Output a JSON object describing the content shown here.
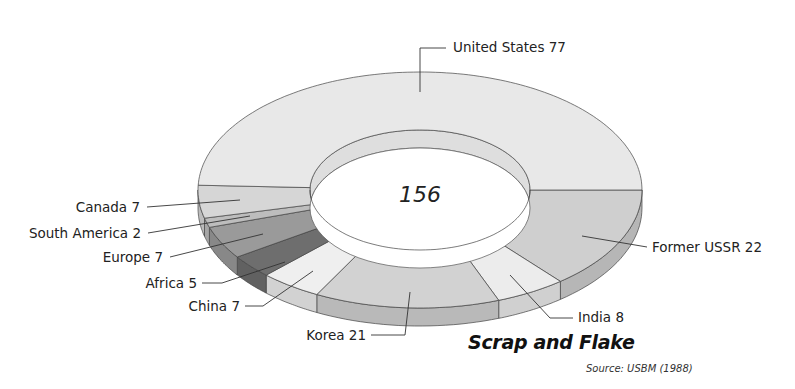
{
  "chart_data": {
    "type": "pie",
    "subtype": "3d-donut",
    "title": "Scrap and Flake",
    "source": "Source: USBM (1988)",
    "center_label": "156",
    "total": 156,
    "categories": [
      "Former USSR",
      "India",
      "Korea",
      "China",
      "Africa",
      "Europe",
      "South America",
      "Canada",
      "United States"
    ],
    "values": [
      22,
      8,
      21,
      7,
      5,
      7,
      2,
      7,
      77
    ],
    "labels": [
      "Former USSR 22",
      "India 8",
      "Korea 21",
      "China 7",
      "Africa 5",
      "Europe 7",
      "South America 2",
      "Canada 7",
      "United States 77"
    ],
    "colors": [
      "#cfcfcf",
      "#ececec",
      "#d2d2d2",
      "#efefef",
      "#6e6e6e",
      "#9a9a9a",
      "#bdbdbd",
      "#d6d6d6",
      "#e8e8e8"
    ],
    "legend": "leader-line labels"
  }
}
